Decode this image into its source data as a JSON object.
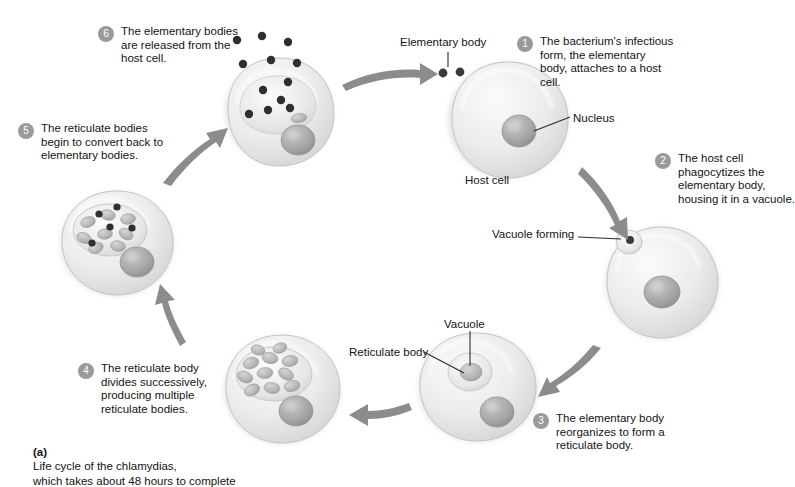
{
  "figure": {
    "caption_label": "(a)",
    "caption_text": "Life cycle of the chlamydias,\nwhich takes about 48 hours to complete"
  },
  "steps": [
    {
      "number": "1",
      "text": "The bacterium's infectious\nform, the elementary\nbody, attaches to a host\ncell."
    },
    {
      "number": "2",
      "text": "The host cell\nphagocytizes the\nelementary body,\nhousing it in a vacuole."
    },
    {
      "number": "3",
      "text": "The elementary body\nreorganizes to form a\nreticulate body."
    },
    {
      "number": "4",
      "text": "The reticulate body\ndivides successively,\nproducing multiple\nreticulate bodies."
    },
    {
      "number": "5",
      "text": "The reticulate bodies\nbegin to convert back to\nelementary bodies."
    },
    {
      "number": "6",
      "text": "The elementary bodies\nare released from the\nhost cell."
    }
  ],
  "labels": {
    "elementary_body": "Elementary body",
    "nucleus": "Nucleus",
    "host_cell": "Host cell",
    "vacuole_forming": "Vacuole forming",
    "vacuole": "Vacuole",
    "reticulate_body": "Reticulate body"
  },
  "colors": {
    "badge_fill": "#9a9a9a",
    "badge_text": "#ffffff",
    "arrow": "#8c8c8c",
    "cell_light": "#f2f2f2",
    "cell_mid": "#d9d9d9",
    "cell_edge": "#bdbdbd",
    "nucleus": "#a8a8a8",
    "elementary_body": "#3a3a3a",
    "reticulate_body": "#b5b5b5",
    "leader_line": "#2b2b2b",
    "text": "#141414",
    "background": "#ffffff"
  },
  "cells": [
    {
      "name": "host-cell-stage-1",
      "contents": "nucleus only, two elementary bodies outside"
    },
    {
      "name": "host-cell-stage-2",
      "contents": "nucleus and small vacuole with elementary body"
    },
    {
      "name": "host-cell-stage-3",
      "contents": "nucleus and vacuole with single reticulate body"
    },
    {
      "name": "host-cell-stage-4",
      "contents": "nucleus and vacuole with many reticulate bodies"
    },
    {
      "name": "host-cell-stage-5",
      "contents": "nucleus and vacuole with reticulate and elementary bodies"
    },
    {
      "name": "host-cell-stage-6",
      "contents": "lysing cell releasing elementary bodies"
    }
  ]
}
